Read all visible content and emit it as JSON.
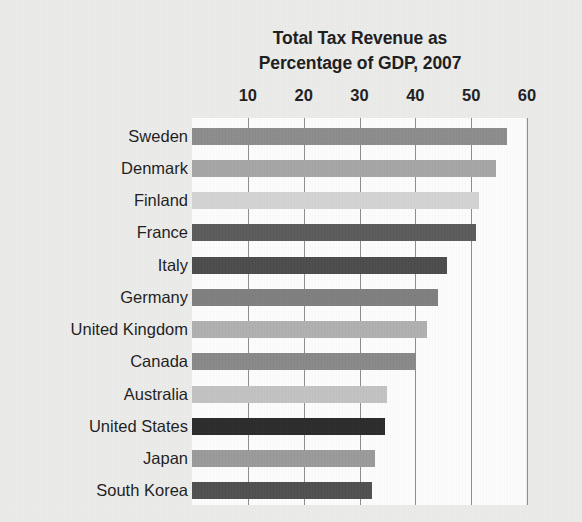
{
  "chart_data": {
    "type": "bar",
    "orientation": "horizontal",
    "title": "Total Tax Revenue as Percentage of GDP, 2007",
    "title_lines": [
      "Total Tax Revenue as",
      "Percentage of GDP, 2007"
    ],
    "xlabel": "",
    "ylabel": "",
    "xlim": [
      0,
      60
    ],
    "xticks": [
      10,
      20,
      30,
      40,
      50,
      60
    ],
    "xtick_labels": [
      "10",
      "20",
      "30",
      "40",
      "50",
      "60"
    ],
    "grid": true,
    "grid_axis": "x",
    "legend": false,
    "axis_position": "top",
    "categories": [
      "Sweden",
      "Denmark",
      "Finland",
      "France",
      "Italy",
      "Germany",
      "United Kingdom",
      "Canada",
      "Australia",
      "United States",
      "Japan",
      "South Korea"
    ],
    "values": [
      56.5,
      54.5,
      51.4,
      50.9,
      45.7,
      44.1,
      42.1,
      40.1,
      35.0,
      34.5,
      32.7,
      32.3
    ],
    "bar_colors": [
      "#8c8c8c",
      "#a6a6a6",
      "#d3d3d3",
      "#5a5a5a",
      "#4b4b4b",
      "#7e7e7e",
      "#b0b0b0",
      "#888888",
      "#c2c2c2",
      "#2a2a2a",
      "#9a9a9a",
      "#4f4f4f"
    ],
    "series": [
      {
        "name": "Total tax revenue as percentage of GDP, 2007",
        "values": [
          56.5,
          54.5,
          51.4,
          50.9,
          45.7,
          44.1,
          42.1,
          40.1,
          35.0,
          34.5,
          32.7,
          32.3
        ]
      }
    ]
  },
  "style": {
    "page_background": "#ececeb",
    "plot_background": "#fdfdfd",
    "gridline_color": "#8d8d8d",
    "text_color": "#1c1c1c"
  }
}
